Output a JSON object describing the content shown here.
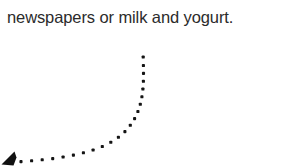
{
  "page": {
    "background_color": "#ffffff",
    "width": 285,
    "height": 166
  },
  "caption": {
    "text": "newspapers or milk and yogurt.",
    "color": "#2b2b2b"
  },
  "figure": {
    "name": "dotted-curve-arrow",
    "dot_color": "#141414",
    "arrowhead_color": "#111111",
    "dot_size": 3.1,
    "direction": "left-down",
    "arrowhead_points": "14.5,151.5 1.5,164.5 13.5,165.5 16.5,157.5",
    "dots": [
      [
        21.0,
        161.6
      ],
      [
        31.6,
        160.8
      ],
      [
        42.2,
        159.8
      ],
      [
        52.7,
        158.6
      ],
      [
        63.1,
        157.0
      ],
      [
        73.4,
        155.1
      ],
      [
        83.4,
        152.8
      ],
      [
        93.1,
        150.0
      ],
      [
        102.3,
        146.5
      ],
      [
        110.8,
        142.3
      ],
      [
        118.4,
        137.3
      ],
      [
        124.9,
        131.6
      ],
      [
        130.3,
        125.3
      ],
      [
        134.6,
        118.6
      ],
      [
        137.9,
        111.5
      ],
      [
        140.3,
        104.2
      ],
      [
        141.9,
        96.7
      ],
      [
        142.9,
        89.0
      ],
      [
        143.4,
        81.2
      ],
      [
        143.5,
        73.4
      ],
      [
        143.4,
        65.5
      ],
      [
        143.2,
        57.0
      ]
    ]
  }
}
